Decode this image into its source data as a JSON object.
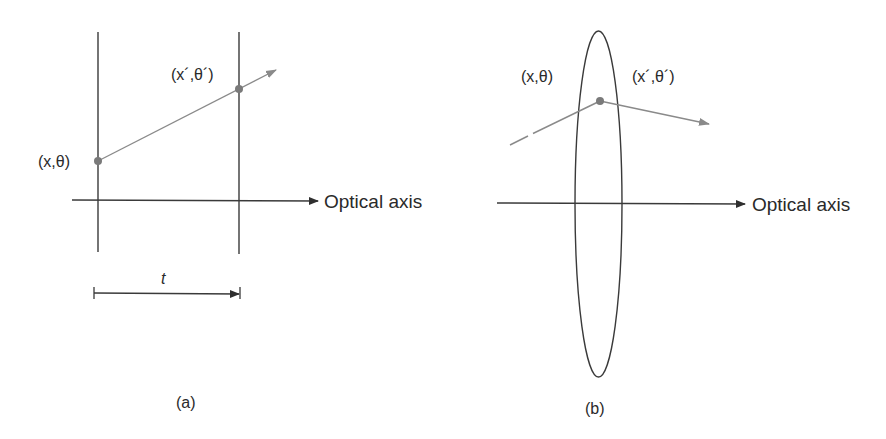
{
  "figure": {
    "panel_a": {
      "caption": "(a)",
      "axis_label": "Optical axis",
      "input_point_label": "(x,θ)",
      "output_point_label": "(x´,θ´)",
      "distance_label": "t"
    },
    "panel_b": {
      "caption": "(b)",
      "axis_label": "Optical axis",
      "input_point_label": "(x,θ)",
      "output_point_label": "(x´,θ´)"
    },
    "colors": {
      "line": "#3a3a3a",
      "ray": "#8a8a8a",
      "point": "#7a7a7a"
    }
  }
}
